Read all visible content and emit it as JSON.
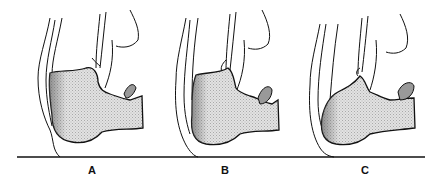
{
  "figure": {
    "panels": [
      {
        "label": "A",
        "label_x": 82
      },
      {
        "label": "B",
        "label_x": 215
      },
      {
        "label": "C",
        "label_x": 355
      }
    ],
    "colors": {
      "line": "#111111",
      "bone_fill": "#d9d9d9",
      "bone_shade": "#8a8a8a",
      "background": "#ffffff"
    }
  }
}
